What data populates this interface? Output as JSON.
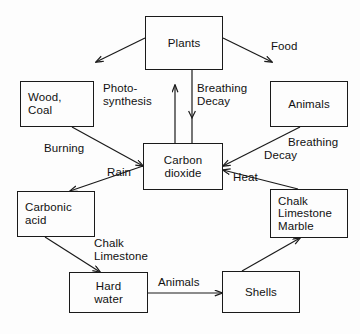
{
  "diagram": {
    "background_color": "#fdfdfd",
    "line_color": "#1a1a1a",
    "text_color": "#111111",
    "nodes": [
      {
        "id": "plants",
        "label": "Plants",
        "x": 145,
        "y": 16,
        "w": 78,
        "h": 54,
        "align": "center"
      },
      {
        "id": "wood_coal",
        "label": "Wood,\nCoal",
        "x": 20,
        "y": 81,
        "w": 74,
        "h": 46,
        "align": "left"
      },
      {
        "id": "animals",
        "label": "Animals",
        "x": 270,
        "y": 81,
        "w": 78,
        "h": 46,
        "align": "center"
      },
      {
        "id": "co2",
        "label": "Carbon\ndioxide",
        "x": 143,
        "y": 143,
        "w": 80,
        "h": 47,
        "align": "center"
      },
      {
        "id": "carbonic",
        "label": "Carbonic\nacid",
        "x": 17,
        "y": 191,
        "w": 78,
        "h": 46,
        "align": "left"
      },
      {
        "id": "chalk",
        "label": "Chalk\nLimestone\nMarble",
        "x": 270,
        "y": 189,
        "w": 78,
        "h": 49,
        "align": "left"
      },
      {
        "id": "hard",
        "label": "Hard\nwater",
        "x": 69,
        "y": 272,
        "w": 79,
        "h": 41,
        "align": "center"
      },
      {
        "id": "shells",
        "label": "Shells",
        "x": 222,
        "y": 271,
        "w": 78,
        "h": 42,
        "align": "center"
      }
    ],
    "edge_labels": [
      {
        "id": "photosynthesis",
        "text": "Photo-\nsynthesis",
        "x": 103,
        "y": 82,
        "align": "left"
      },
      {
        "id": "breathing_decay_top",
        "text": "Breathing\nDecay",
        "x": 197,
        "y": 82,
        "align": "left"
      },
      {
        "id": "food",
        "text": "Food",
        "x": 271,
        "y": 40,
        "align": "left"
      },
      {
        "id": "burning",
        "text": "Burning",
        "x": 44,
        "y": 142,
        "align": "left"
      },
      {
        "id": "breathing_decay_right",
        "text": "Breathing",
        "x": 288,
        "y": 136,
        "align": "left"
      },
      {
        "id": "decay_right",
        "text": "Decay",
        "x": 264,
        "y": 149,
        "align": "left"
      },
      {
        "id": "rain",
        "text": "Rain",
        "x": 107,
        "y": 166,
        "align": "left"
      },
      {
        "id": "heat",
        "text": "Heat",
        "x": 233,
        "y": 171,
        "align": "left"
      },
      {
        "id": "chalk_limestone",
        "text": "Chalk\nLimestone",
        "x": 94,
        "y": 237,
        "align": "left"
      },
      {
        "id": "animals_bottom",
        "text": "Animals",
        "x": 158,
        "y": 276,
        "align": "left"
      }
    ],
    "edges": [
      {
        "id": "plants-to-wood",
        "from": "plants",
        "to": "wood_coal",
        "label": ""
      },
      {
        "id": "plants-to-animals",
        "from": "plants",
        "to": "animals",
        "label": "Food"
      },
      {
        "id": "co2-to-plants",
        "from": "co2",
        "to": "plants",
        "label": "Photo-synthesis"
      },
      {
        "id": "plants-to-co2",
        "from": "plants",
        "to": "co2",
        "label": "Breathing Decay"
      },
      {
        "id": "wood-to-co2",
        "from": "wood_coal",
        "to": "co2",
        "label": "Burning"
      },
      {
        "id": "animals-to-co2",
        "from": "animals",
        "to": "co2",
        "label": "Breathing Decay"
      },
      {
        "id": "co2-to-carbonic",
        "from": "co2",
        "to": "carbonic",
        "label": "Rain"
      },
      {
        "id": "chalk-to-co2",
        "from": "chalk",
        "to": "co2",
        "label": "Heat"
      },
      {
        "id": "carbonic-to-hard",
        "from": "carbonic",
        "to": "hard",
        "label": "Chalk Limestone"
      },
      {
        "id": "hard-to-shells",
        "from": "hard",
        "to": "shells",
        "label": "Animals"
      },
      {
        "id": "shells-to-chalk",
        "from": "shells",
        "to": "chalk",
        "label": ""
      }
    ]
  }
}
